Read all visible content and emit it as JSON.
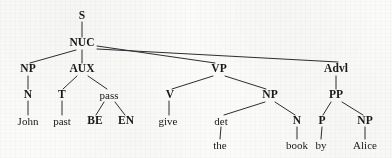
{
  "figure": {
    "kind": "syntax-tree",
    "sentence": "John past BE EN give the book by Alice",
    "ink_color": "#19191c",
    "edge_color": "#2e2e33",
    "background_color": "#fbfbfa"
  },
  "nodes": {
    "s": {
      "label": "S",
      "x": 82,
      "y": 16,
      "style": "cat"
    },
    "nuc": {
      "label": "NUC",
      "x": 82,
      "y": 43,
      "style": "cat"
    },
    "np_subj": {
      "label": "NP",
      "x": 28,
      "y": 69,
      "style": "cat"
    },
    "aux": {
      "label": "AUX",
      "x": 82,
      "y": 69,
      "style": "cat"
    },
    "vp": {
      "label": "VP",
      "x": 219,
      "y": 69,
      "style": "cat"
    },
    "advl": {
      "label": "Advl",
      "x": 336,
      "y": 69,
      "style": "cat"
    },
    "n_subj": {
      "label": "N",
      "x": 28,
      "y": 95,
      "style": "cat"
    },
    "t": {
      "label": "T",
      "x": 62,
      "y": 95,
      "style": "cat"
    },
    "pass": {
      "label": "pass",
      "x": 109,
      "y": 95,
      "style": "cat-lc"
    },
    "v": {
      "label": "V",
      "x": 170,
      "y": 95,
      "style": "cat"
    },
    "np_obj": {
      "label": "NP",
      "x": 270,
      "y": 95,
      "style": "cat"
    },
    "pp": {
      "label": "PP",
      "x": 336,
      "y": 95,
      "style": "cat"
    },
    "john": {
      "label": "John",
      "x": 28,
      "y": 121,
      "style": "leaf"
    },
    "past": {
      "label": "past",
      "x": 62,
      "y": 121,
      "style": "leaf"
    },
    "be": {
      "label": "BE",
      "x": 95,
      "y": 121,
      "style": "cat"
    },
    "en": {
      "label": "EN",
      "x": 126,
      "y": 121,
      "style": "cat"
    },
    "give": {
      "label": "give",
      "x": 168,
      "y": 121,
      "style": "leaf"
    },
    "det": {
      "label": "det",
      "x": 221,
      "y": 121,
      "style": "cat-lc"
    },
    "n_obj": {
      "label": "N",
      "x": 297,
      "y": 121,
      "style": "cat"
    },
    "p": {
      "label": "P",
      "x": 322,
      "y": 121,
      "style": "cat"
    },
    "np_agent": {
      "label": "NP",
      "x": 365,
      "y": 121,
      "style": "cat"
    },
    "the": {
      "label": "the",
      "x": 220,
      "y": 145,
      "style": "leaf"
    },
    "book": {
      "label": "book",
      "x": 297,
      "y": 145,
      "style": "leaf"
    },
    "by": {
      "label": "by",
      "x": 321,
      "y": 145,
      "style": "leaf"
    },
    "alice": {
      "label": "Alice",
      "x": 365,
      "y": 145,
      "style": "leaf"
    }
  },
  "edges": [
    {
      "name": "edge-s-nuc",
      "from": "s",
      "to": "nuc",
      "x1": 82,
      "y1": 22,
      "x2": 82,
      "y2": 37
    },
    {
      "name": "edge-nuc-np-subject",
      "from": "nuc",
      "to": "np_subj",
      "x1": 76,
      "y1": 50,
      "x2": 30,
      "y2": 63
    },
    {
      "name": "edge-nuc-aux",
      "from": "nuc",
      "to": "aux",
      "x1": 82,
      "y1": 50,
      "x2": 82,
      "y2": 63
    },
    {
      "name": "edge-nuc-vp",
      "from": "nuc",
      "to": "vp",
      "x1": 97,
      "y1": 46,
      "x2": 215,
      "y2": 63
    },
    {
      "name": "edge-nuc-advl",
      "from": "nuc",
      "to": "advl",
      "x1": 97,
      "y1": 49,
      "x2": 338,
      "y2": 62
    },
    {
      "name": "edge-np-n-subject",
      "from": "np_subj",
      "to": "n_subj",
      "x1": 28,
      "y1": 76,
      "x2": 28,
      "y2": 89
    },
    {
      "name": "edge-aux-t",
      "from": "aux",
      "to": "t",
      "x1": 77,
      "y1": 76,
      "x2": 63,
      "y2": 89
    },
    {
      "name": "edge-aux-pass",
      "from": "aux",
      "to": "pass",
      "x1": 88,
      "y1": 76,
      "x2": 107,
      "y2": 89
    },
    {
      "name": "edge-n-john",
      "from": "n_subj",
      "to": "john",
      "x1": 28,
      "y1": 101,
      "x2": 28,
      "y2": 115
    },
    {
      "name": "edge-t-past",
      "from": "t",
      "to": "past",
      "x1": 62,
      "y1": 101,
      "x2": 62,
      "y2": 115
    },
    {
      "name": "edge-pass-be",
      "from": "pass",
      "to": "be",
      "x1": 104,
      "y1": 102,
      "x2": 96,
      "y2": 115
    },
    {
      "name": "edge-pass-en",
      "from": "pass",
      "to": "en",
      "x1": 115,
      "y1": 102,
      "x2": 125,
      "y2": 115
    },
    {
      "name": "edge-vp-v",
      "from": "vp",
      "to": "v",
      "x1": 213,
      "y1": 76,
      "x2": 172,
      "y2": 89
    },
    {
      "name": "edge-vp-np-object",
      "from": "vp",
      "to": "np_obj",
      "x1": 225,
      "y1": 76,
      "x2": 266,
      "y2": 89
    },
    {
      "name": "edge-v-give",
      "from": "v",
      "to": "give",
      "x1": 169,
      "y1": 101,
      "x2": 169,
      "y2": 115
    },
    {
      "name": "edge-np-det",
      "from": "np_obj",
      "to": "det",
      "x1": 265,
      "y1": 102,
      "x2": 224,
      "y2": 115
    },
    {
      "name": "edge-np-n-object",
      "from": "np_obj",
      "to": "n_obj",
      "x1": 275,
      "y1": 102,
      "x2": 295,
      "y2": 115
    },
    {
      "name": "edge-det-the",
      "from": "det",
      "to": "the",
      "x1": 221,
      "y1": 127,
      "x2": 220,
      "y2": 139
    },
    {
      "name": "edge-n-book",
      "from": "n_obj",
      "to": "book",
      "x1": 297,
      "y1": 127,
      "x2": 297,
      "y2": 139
    },
    {
      "name": "edge-advl-pp",
      "from": "advl",
      "to": "pp",
      "x1": 336,
      "y1": 76,
      "x2": 336,
      "y2": 89
    },
    {
      "name": "edge-pp-p",
      "from": "pp",
      "to": "p",
      "x1": 331,
      "y1": 102,
      "x2": 323,
      "y2": 115
    },
    {
      "name": "edge-pp-np-agent",
      "from": "pp",
      "to": "np_agent",
      "x1": 342,
      "y1": 102,
      "x2": 363,
      "y2": 115
    },
    {
      "name": "edge-p-by",
      "from": "p",
      "to": "by",
      "x1": 322,
      "y1": 127,
      "x2": 321,
      "y2": 139
    },
    {
      "name": "edge-np-alice",
      "from": "np_agent",
      "to": "alice",
      "x1": 365,
      "y1": 127,
      "x2": 365,
      "y2": 139
    }
  ]
}
